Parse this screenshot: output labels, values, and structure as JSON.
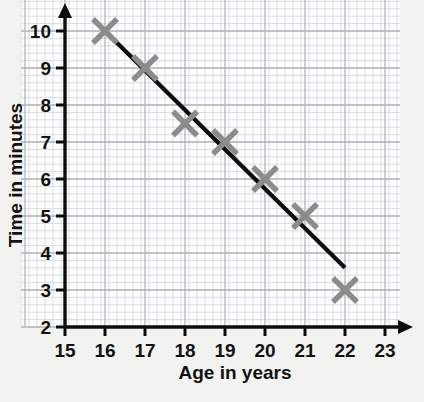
{
  "chart_data": {
    "type": "scatter",
    "title": "",
    "xlabel": "Age in years",
    "ylabel": "Time in minutes",
    "xlim": [
      15,
      23.6
    ],
    "ylim": [
      2,
      10.6
    ],
    "xticks": [
      15,
      16,
      17,
      18,
      19,
      20,
      21,
      22,
      23
    ],
    "yticks": [
      2,
      3,
      4,
      5,
      6,
      7,
      8,
      9,
      10
    ],
    "xtick_labels": [
      "15",
      "16",
      "17",
      "18",
      "19",
      "20",
      "21",
      "22",
      "23"
    ],
    "ytick_labels": [
      "2",
      "3",
      "4",
      "5",
      "6",
      "7",
      "8",
      "9",
      "10"
    ],
    "grid": true,
    "grid_minor_step": 0.2,
    "grid_major_step": 1,
    "legend": false,
    "marker": "x",
    "marker_color": "#8c8c8c",
    "x": [
      16,
      17,
      18,
      19,
      20,
      21,
      22
    ],
    "y": [
      10,
      9,
      7.5,
      7,
      6,
      5,
      3
    ],
    "points": [
      {
        "x": 16,
        "y": 10
      },
      {
        "x": 17,
        "y": 9
      },
      {
        "x": 18,
        "y": 7.5
      },
      {
        "x": 19,
        "y": 7
      },
      {
        "x": 20,
        "y": 6
      },
      {
        "x": 21,
        "y": 5
      },
      {
        "x": 22,
        "y": 3
      }
    ],
    "series": [
      {
        "name": "data points",
        "type": "scatter",
        "values": [
          10,
          9,
          7.5,
          7,
          6,
          5,
          3
        ]
      },
      {
        "name": "line of best fit",
        "type": "line",
        "color": "#0d0d0d",
        "x": [
          16,
          22
        ],
        "y": [
          10,
          3.6
        ]
      }
    ],
    "trend_line": {
      "x_start": 16,
      "y_start": 10,
      "x_end": 22,
      "y_end": 3.6,
      "color": "#0d0d0d"
    },
    "axis_color": "#0d0d0d",
    "grid_color": "#b9bec4",
    "background": "#ffffff"
  }
}
